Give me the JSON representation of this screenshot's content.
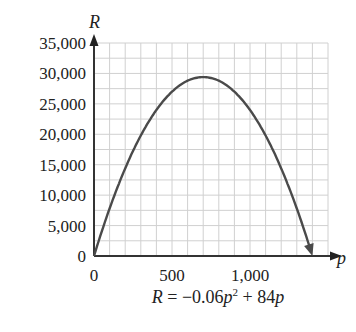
{
  "chart_data": {
    "type": "line",
    "title": "",
    "caption": "R = −0.06p² + 84p",
    "xlabel": "p",
    "ylabel": "R",
    "xlim": [
      0,
      1500
    ],
    "ylim": [
      0,
      35000
    ],
    "x_ticks": [
      0,
      500,
      1000
    ],
    "x_tick_labels": [
      "0",
      "500",
      "1,000"
    ],
    "y_ticks": [
      0,
      5000,
      10000,
      15000,
      20000,
      25000,
      30000,
      35000
    ],
    "y_tick_labels": [
      "0",
      "5,000",
      "10,000",
      "15,000",
      "20,000",
      "25,000",
      "30,000",
      "35,000"
    ],
    "grid": true,
    "grid_minor_x_step": 100,
    "grid_minor_y_step": 2500,
    "series": [
      {
        "name": "R = -0.06p^2 + 84p",
        "x": [
          0,
          100,
          200,
          300,
          400,
          500,
          600,
          700,
          800,
          900,
          1000,
          1100,
          1200,
          1300,
          1400
        ],
        "values": [
          0,
          7800,
          14400,
          19800,
          24000,
          27000,
          28800,
          29400,
          28800,
          27000,
          24000,
          19800,
          14400,
          7800,
          0
        ]
      }
    ],
    "colors": {
      "curve": "#4a4a4a",
      "axis": "#333333",
      "grid": "#d0d0d0"
    }
  },
  "labels": {
    "y_axis": "R",
    "x_axis": "p",
    "equation_lhs": "R",
    "equation_mid": " = −0.06",
    "equation_var1": "p",
    "equation_exp": "2",
    "equation_plus": " + 84",
    "equation_var2": "p"
  }
}
